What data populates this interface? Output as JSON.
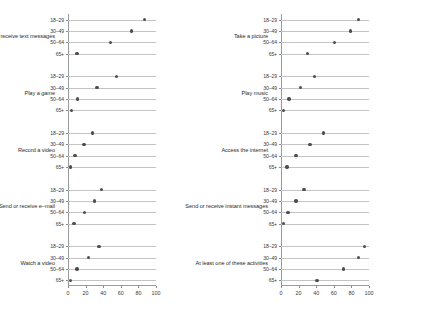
{
  "chart_data": {
    "type": "scatter",
    "title": "",
    "subtitle": "",
    "xlabel": "",
    "ylabel": "",
    "xlim": [
      0,
      100
    ],
    "xticks": [
      0,
      20,
      40,
      60,
      80,
      100
    ],
    "xtick_labels": [
      "0",
      "20",
      "40",
      "60",
      "80",
      "100"
    ],
    "grid": "horizontal-row-lines",
    "legend": "none",
    "age_groups": [
      "18–29",
      "30–49",
      "50–64",
      "65+"
    ],
    "panels": [
      {
        "name": "left",
        "groups": [
          {
            "label": "Send or receive text messages",
            "categories": [
              "18–29",
              "30–49",
              "50–64",
              "65+"
            ],
            "values": [
              87,
              72,
              48,
              10
            ]
          },
          {
            "label": "Play a game",
            "categories": [
              "18–29",
              "30–49",
              "50–64",
              "65+"
            ],
            "values": [
              55,
              33,
              11,
              4
            ]
          },
          {
            "label": "Record a video",
            "categories": [
              "18–29",
              "30–49",
              "50–64",
              "65+"
            ],
            "values": [
              28,
              18,
              8,
              3
            ]
          },
          {
            "label": "Send or receive e–mail",
            "categories": [
              "18–29",
              "30–49",
              "50–64",
              "65+"
            ],
            "values": [
              38,
              30,
              19,
              7
            ]
          },
          {
            "label": "Watch a video",
            "categories": [
              "18–29",
              "30–49",
              "50–64",
              "65+"
            ],
            "values": [
              35,
              23,
              10,
              3
            ]
          }
        ]
      },
      {
        "name": "right",
        "groups": [
          {
            "label": "Take a picture",
            "categories": [
              "18–29",
              "30–49",
              "50–64",
              "65+"
            ],
            "values": [
              88,
              79,
              61,
              30
            ]
          },
          {
            "label": "Play music",
            "categories": [
              "18–29",
              "30–49",
              "50–64",
              "65+"
            ],
            "values": [
              38,
              22,
              9,
              3
            ]
          },
          {
            "label": "Access the internet",
            "categories": [
              "18–29",
              "30–49",
              "50–64",
              "65+"
            ],
            "values": [
              48,
              33,
              17,
              7
            ]
          },
          {
            "label": "Send or receive instant messages",
            "categories": [
              "18–29",
              "30–49",
              "50–64",
              "65+"
            ],
            "values": [
              26,
              17,
              8,
              3
            ]
          },
          {
            "label": "At least one of these activities",
            "categories": [
              "18–29",
              "30–49",
              "50–64",
              "65+"
            ],
            "values": [
              95,
              88,
              71,
              41
            ]
          }
        ]
      }
    ],
    "colors": {
      "dot": "#4d4d4d",
      "row_line": "#c4c4c4",
      "axis": "#8a8a8a",
      "text": "#2b2b2b",
      "background": "#ffffff"
    }
  }
}
